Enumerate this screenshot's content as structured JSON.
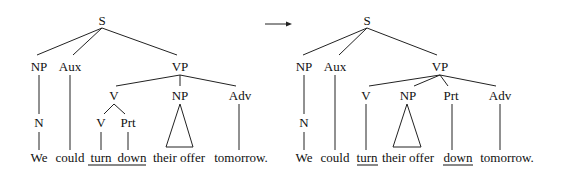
{
  "diagram": {
    "type": "syntax-tree-transformation",
    "arrow": "right-arrow",
    "trees": [
      {
        "id": "before",
        "nodes": {
          "S": "S",
          "NP_subj": "NP",
          "Aux": "Aux",
          "VP": "VP",
          "V_complex": "V",
          "NP_obj": "NP",
          "Adv": "Adv",
          "N": "N",
          "V": "V",
          "Prt": "Prt"
        },
        "words": {
          "we": "We",
          "could": "could",
          "turn": "turn",
          "down": "down",
          "their_offer": "their offer",
          "tomorrow": "tomorrow."
        },
        "underlined": [
          "turn",
          "down"
        ]
      },
      {
        "id": "after",
        "nodes": {
          "S": "S",
          "NP_subj": "NP",
          "Aux": "Aux",
          "VP": "VP",
          "V": "V",
          "NP_obj": "NP",
          "Prt": "Prt",
          "Adv": "Adv",
          "N": "N"
        },
        "words": {
          "we": "We",
          "could": "could",
          "turn": "turn",
          "their_offer": "their offer",
          "down": "down",
          "tomorrow": "tomorrow."
        },
        "underlined": [
          "turn",
          "down"
        ]
      }
    ]
  }
}
